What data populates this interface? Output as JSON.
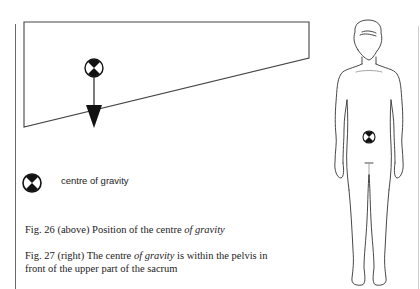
{
  "figure26": {
    "diagram": "tilted-block-with-centre-of-gravity",
    "symbol_icon": "centre-of-gravity-icon",
    "arrow_icon": "downward-arrow-icon"
  },
  "legend": {
    "icon": "centre-of-gravity-icon",
    "label": "centre of gravity"
  },
  "captions": {
    "fig26": {
      "prefix": "Fig. 26 (above) Position of the centre ",
      "italic": "of gravity"
    },
    "fig27": {
      "line1_prefix": "Fig. 27 (right) The centre ",
      "line1_italic": "of gravity",
      "line1_suffix": " is within the pelvis in",
      "line2": "front of the upper part of the sacrum"
    }
  },
  "figure27": {
    "diagram": "human-figure-front-view",
    "symbol_icon": "centre-of-gravity-icon"
  },
  "colors": {
    "ink": "#222222",
    "rule": "#6a6a6a",
    "rule_light": "#cfcfcf"
  }
}
